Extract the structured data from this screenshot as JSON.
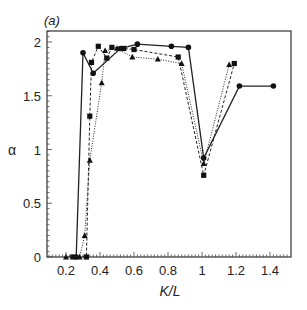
{
  "chart_data": {
    "type": "line",
    "title": "",
    "panel_label": "(a)",
    "xlabel": "K/L",
    "ylabel": "α",
    "xlim": [
      0.09,
      1.52
    ],
    "ylim": [
      0,
      2.1
    ],
    "grid": false,
    "legend": "none",
    "x_ticks": [
      0.2,
      0.4,
      0.6,
      0.8,
      1,
      1.2,
      1.4
    ],
    "x_tick_labels": [
      "0.2",
      "0.4",
      "0.6",
      "0.8",
      "1",
      "1.2",
      "1.4"
    ],
    "y_ticks": [
      0,
      0.5,
      1,
      1.5,
      2
    ],
    "y_tick_labels": [
      "0",
      "0.5",
      "1",
      "1.5",
      "2"
    ],
    "series": [
      {
        "name": "circles (solid line)",
        "marker": "circle",
        "line": "solid",
        "x": [
          0.26,
          0.3,
          0.36,
          0.52,
          0.62,
          0.82,
          0.92,
          1.01,
          1.22,
          1.42
        ],
        "y": [
          0.0,
          1.9,
          1.71,
          1.94,
          1.98,
          1.96,
          1.95,
          0.92,
          1.59,
          1.59
        ]
      },
      {
        "name": "squares (dashed line)",
        "marker": "square",
        "line": "dashed",
        "x": [
          0.24,
          0.32,
          0.34,
          0.35,
          0.39,
          0.44,
          0.47,
          0.54,
          0.6,
          0.86,
          1.01,
          1.19
        ],
        "y": [
          0.0,
          0.0,
          1.31,
          1.81,
          1.96,
          1.85,
          1.95,
          1.94,
          1.93,
          1.86,
          0.76,
          1.8
        ]
      },
      {
        "name": "triangles (dotted line)",
        "marker": "triangle",
        "line": "dotted",
        "x": [
          0.2,
          0.28,
          0.31,
          0.34,
          0.41,
          0.43,
          0.5,
          0.59,
          0.74,
          0.88,
          1.01,
          1.16
        ],
        "y": [
          0.0,
          0.0,
          0.2,
          0.9,
          1.62,
          1.92,
          1.94,
          1.86,
          1.84,
          1.8,
          0.87,
          1.79
        ]
      }
    ]
  }
}
